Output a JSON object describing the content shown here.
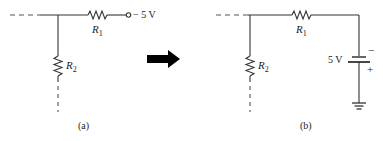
{
  "figure": {
    "panel_a": {
      "caption": "(a)",
      "resistor_1": {
        "name": "R",
        "subscript": "1"
      },
      "resistor_2": {
        "name": "R",
        "subscript": "2"
      },
      "terminal_label": "− 5 V"
    },
    "arrow": {
      "direction": "right",
      "color": "#000000"
    },
    "panel_b": {
      "caption": "(b)",
      "resistor_1": {
        "name": "R",
        "subscript": "1"
      },
      "resistor_2": {
        "name": "R",
        "subscript": "2"
      },
      "source_label": "5 V",
      "source_minus": "−",
      "source_plus": "+"
    },
    "colors": {
      "wire": "#333333",
      "dashed": "#555555",
      "text": "#222222"
    }
  }
}
